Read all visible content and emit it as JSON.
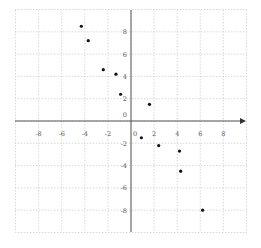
{
  "chart_data": {
    "type": "scatter",
    "title": "",
    "xlabel": "",
    "ylabel": "",
    "xlim": [
      -10,
      10
    ],
    "ylim": [
      -10,
      10
    ],
    "grid": true,
    "x_ticks": [
      -8,
      -6,
      -4,
      -2,
      0,
      2,
      4,
      6,
      8
    ],
    "y_ticks": [
      8,
      6,
      4,
      2,
      0,
      -2,
      -4,
      -6,
      -8
    ],
    "x_tick_labels": [
      "-8",
      "-6",
      "-4",
      "-2",
      "0",
      "2",
      "4",
      "6",
      "8"
    ],
    "y_tick_labels": [
      "8",
      "6",
      "4",
      "2",
      "0",
      "-2",
      "-4",
      "-6",
      "-8"
    ],
    "series": [
      {
        "name": "points",
        "color": "#111111",
        "points": [
          {
            "x": -4.3,
            "y": 8.5
          },
          {
            "x": -3.7,
            "y": 7.2
          },
          {
            "x": -2.4,
            "y": 4.6
          },
          {
            "x": -1.3,
            "y": 4.2
          },
          {
            "x": -0.9,
            "y": 2.4
          },
          {
            "x": 1.6,
            "y": 1.5
          },
          {
            "x": 0.9,
            "y": -1.5
          },
          {
            "x": 2.4,
            "y": -2.2
          },
          {
            "x": 4.2,
            "y": -2.7
          },
          {
            "x": 4.3,
            "y": -4.5
          },
          {
            "x": 6.2,
            "y": -8.0
          }
        ]
      }
    ]
  }
}
